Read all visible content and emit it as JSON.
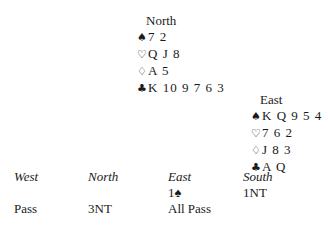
{
  "hands": {
    "north": {
      "title": "North",
      "spades": "7 2",
      "hearts": "Q J 8",
      "diamonds": "A 5",
      "clubs": "K 10 9 7 6 3"
    },
    "east": {
      "title": "East",
      "spades": "K Q 9 5 4",
      "hearts": "7 6 2",
      "diamonds": "J 8 3",
      "clubs": "A Q"
    }
  },
  "suit_symbols": {
    "spades": "♠",
    "hearts": "♡",
    "diamonds": "♢",
    "clubs": "♣"
  },
  "auction": {
    "headers": [
      "West",
      "North",
      "East",
      "South"
    ],
    "rows": [
      [
        "",
        "",
        "1♠",
        "1NT"
      ],
      [
        "Pass",
        "3NT",
        "All Pass",
        ""
      ]
    ]
  }
}
